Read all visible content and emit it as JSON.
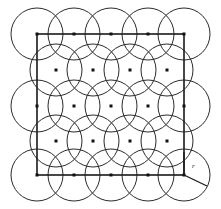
{
  "figure": {
    "caption": "",
    "radius_label": "r",
    "stroke_colors": {
      "circle": "#2b2b2b",
      "square": "#1a1a1a",
      "dot": "#111111",
      "background": "#ffffff"
    },
    "square": {
      "x": 37,
      "y": 34,
      "width": 147,
      "height": 141
    },
    "circle_radius": 26,
    "dot_size": 3,
    "rows": [
      {
        "y": 34,
        "xs": [
          37,
          74,
          111,
          148,
          184
        ]
      },
      {
        "y": 70,
        "xs": [
          56,
          93,
          130,
          167
        ]
      },
      {
        "y": 106,
        "xs": [
          37,
          74,
          111,
          148,
          184
        ]
      },
      {
        "y": 141,
        "xs": [
          56,
          93,
          130,
          167
        ]
      },
      {
        "y": 175,
        "xs": [
          37,
          74,
          111,
          148,
          184
        ]
      }
    ],
    "radius_indicator": {
      "origin_x": 184,
      "origin_y": 175,
      "tip_x": 207,
      "tip_y": 186,
      "vertical_top_y": 152,
      "label_x": 192,
      "label_y": 168
    }
  }
}
